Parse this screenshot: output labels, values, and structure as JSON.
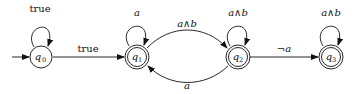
{
  "diagram": {
    "type": "automaton",
    "states": [
      {
        "id": "q0",
        "name": "q",
        "sub": "0",
        "accepting": false,
        "initial": true,
        "x": 41,
        "y": 57
      },
      {
        "id": "q1",
        "name": "q",
        "sub": "1",
        "accepting": true,
        "initial": false,
        "x": 137,
        "y": 57
      },
      {
        "id": "q2",
        "name": "q",
        "sub": "2",
        "accepting": true,
        "initial": false,
        "x": 238,
        "y": 57
      },
      {
        "id": "q3",
        "name": "q",
        "sub": "3",
        "accepting": true,
        "initial": false,
        "x": 331,
        "y": 57
      }
    ],
    "transitions": [
      {
        "from": "q0",
        "to": "q0",
        "label": "true"
      },
      {
        "from": "q0",
        "to": "q1",
        "label": "true"
      },
      {
        "from": "q1",
        "to": "q1",
        "label": "a"
      },
      {
        "from": "q1",
        "to": "q2",
        "label": "a∧b"
      },
      {
        "from": "q2",
        "to": "q2",
        "label": "a∧b"
      },
      {
        "from": "q2",
        "to": "q1",
        "label": "a"
      },
      {
        "from": "q2",
        "to": "q3",
        "label": "¬a"
      },
      {
        "from": "q3",
        "to": "q3",
        "label": "a∧b"
      }
    ]
  }
}
